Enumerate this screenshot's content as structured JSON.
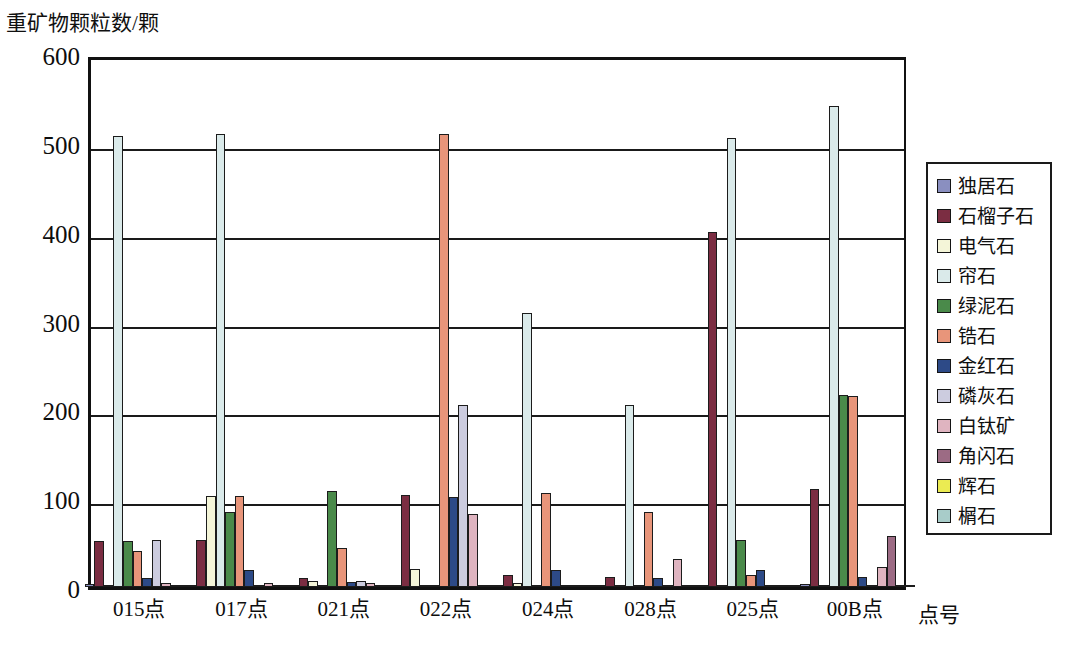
{
  "chart_data": {
    "type": "bar",
    "title": "",
    "xlabel": "点号",
    "ylabel": "重矿物颗粒数/颗",
    "ylim": [
      0,
      600
    ],
    "yticks": [
      0,
      100,
      200,
      300,
      400,
      500,
      600
    ],
    "grid": true,
    "legend_position": "right",
    "categories": [
      "015点",
      "017点",
      "021点",
      "022点",
      "024点",
      "028点",
      "025点",
      "00B点"
    ],
    "series": [
      {
        "name": "独居石",
        "color": "#8a8fc0",
        "values": [
          3,
          0,
          0,
          0,
          0,
          0,
          0,
          3
        ]
      },
      {
        "name": "石榴子石",
        "color": "#7b2d42",
        "values": [
          52,
          53,
          10,
          104,
          14,
          11,
          400,
          110
        ]
      },
      {
        "name": "电气石",
        "color": "#f4f5d8",
        "values": [
          0,
          103,
          7,
          20,
          4,
          0,
          0,
          0
        ]
      },
      {
        "name": "帘石",
        "color": "#daeaea",
        "values": [
          508,
          510,
          0,
          0,
          308,
          205,
          505,
          542
        ]
      },
      {
        "name": "绿泥石",
        "color": "#4a8a4a",
        "values": [
          52,
          84,
          108,
          0,
          0,
          0,
          53,
          216
        ]
      },
      {
        "name": "锆石",
        "color": "#e8957a",
        "values": [
          40,
          103,
          44,
          510,
          106,
          84,
          14,
          215
        ]
      },
      {
        "name": "金红石",
        "color": "#2d4a87",
        "values": [
          10,
          19,
          6,
          101,
          19,
          10,
          19,
          11
        ]
      },
      {
        "name": "磷灰石",
        "color": "#ccccdf",
        "values": [
          53,
          0,
          7,
          205,
          0,
          0,
          0,
          0
        ]
      },
      {
        "name": "白钛矿",
        "color": "#dfb4c0",
        "values": [
          4,
          4,
          4,
          82,
          0,
          32,
          0,
          22
        ]
      },
      {
        "name": "角闪石",
        "color": "#9c6b84",
        "values": [
          0,
          0,
          0,
          0,
          0,
          0,
          0,
          57
        ]
      },
      {
        "name": "辉石",
        "color": "#ebeb52",
        "values": [
          0,
          0,
          0,
          0,
          0,
          0,
          0,
          0
        ]
      },
      {
        "name": "榍石",
        "color": "#a8ccc9",
        "values": [
          0,
          0,
          0,
          0,
          0,
          0,
          0,
          0
        ]
      }
    ]
  },
  "legend": {
    "items": [
      {
        "label": "独居石"
      },
      {
        "label": "石榴子石"
      },
      {
        "label": "电气石"
      },
      {
        "label": "帘石"
      },
      {
        "label": "绿泥石"
      },
      {
        "label": "锆石"
      },
      {
        "label": "金红石"
      },
      {
        "label": "磷灰石"
      },
      {
        "label": "白钛矿"
      },
      {
        "label": "角闪石"
      },
      {
        "label": "辉石"
      },
      {
        "label": "榍石"
      }
    ]
  },
  "caption": ""
}
